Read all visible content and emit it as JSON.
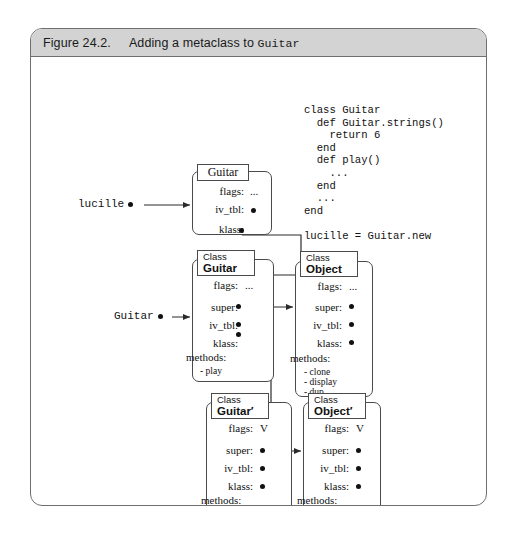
{
  "figure": {
    "caption_number": "Figure 24.2.",
    "caption_text_before": "Adding a metaclass to ",
    "caption_code": "Guitar"
  },
  "code_listing": "class Guitar\n  def Guitar.strings()\n    return 6\n  end\n  def play()\n    ...\n  end\n  ...\nend\n\nlucille = Guitar.new",
  "pointers": {
    "lucille": "lucille",
    "guitar": "Guitar"
  },
  "boxes": {
    "guitar_obj": {
      "head_name": "Guitar",
      "fields": [
        {
          "name": "flags:",
          "value": "..."
        },
        {
          "name": "iv_tbl:",
          "value": "dot"
        },
        {
          "name": "klass:",
          "value": "dot"
        }
      ]
    },
    "class_guitar": {
      "head_kw": "Class",
      "head_name": "Guitar",
      "fields": [
        {
          "name": "flags:",
          "value": "..."
        },
        {
          "name": "super:",
          "value": "dot"
        },
        {
          "name": "iv_tbl:",
          "value": "dot"
        },
        {
          "name": "klass:",
          "value": "dot"
        }
      ],
      "methods_label": "methods:",
      "methods": [
        "- play"
      ]
    },
    "class_object": {
      "head_kw": "Class",
      "head_name": "Object",
      "fields": [
        {
          "name": "flags:",
          "value": "..."
        },
        {
          "name": "super:",
          "value": "dot"
        },
        {
          "name": "iv_tbl:",
          "value": "dot"
        },
        {
          "name": "klass:",
          "value": "dot"
        }
      ],
      "methods_label": "methods:",
      "methods": [
        "- clone",
        "- display",
        "- dup"
      ]
    },
    "class_guitar_prime": {
      "head_kw": "Class",
      "head_name": "Guitar′",
      "fields": [
        {
          "name": "flags:",
          "value": "V"
        },
        {
          "name": "super:",
          "value": "dot"
        },
        {
          "name": "iv_tbl:",
          "value": "dot"
        },
        {
          "name": "klass:",
          "value": "dot"
        }
      ],
      "methods_label": "methods:",
      "methods": [
        "- strings"
      ]
    },
    "class_object_prime": {
      "head_kw": "Class",
      "head_name": "Object′",
      "fields": [
        {
          "name": "flags:",
          "value": "V"
        },
        {
          "name": "super:",
          "value": "dot"
        },
        {
          "name": "iv_tbl:",
          "value": "dot"
        },
        {
          "name": "klass:",
          "value": "dot"
        }
      ],
      "methods_label": "methods:",
      "methods": []
    }
  },
  "colors": {
    "frame_border": "#6f6f6f",
    "caption_bg": "#d3d3d3",
    "box_border": "#4a4a4a",
    "line": "#2b2b2b",
    "text": "#111111"
  }
}
